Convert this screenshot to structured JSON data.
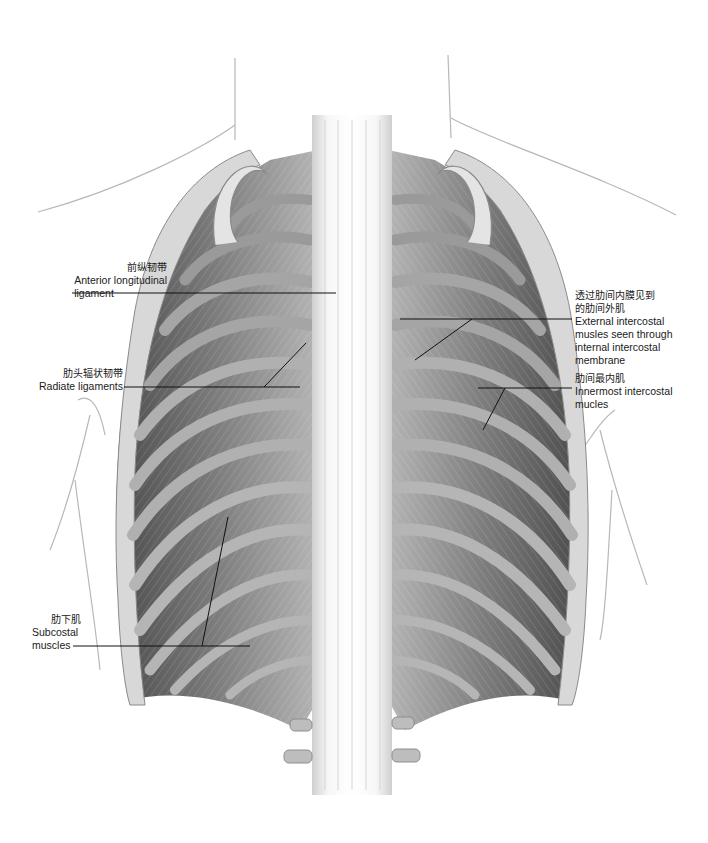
{
  "figure": {
    "labels": [
      {
        "id": "anterior-longitudinal-ligament",
        "zh": "前纵韧带",
        "en": [
          "Anterior longitudinal",
          "ligament"
        ],
        "side": "left"
      },
      {
        "id": "radiate-ligaments",
        "zh": "肋头辐状韧带",
        "en": [
          "Radiate ligaments"
        ],
        "side": "left"
      },
      {
        "id": "subcostal-muscles",
        "zh": "肋下肌",
        "en": [
          "Subcostal",
          "muscles"
        ],
        "side": "left"
      },
      {
        "id": "external-intercostal",
        "zh": [
          "透过肋间内膜见到",
          "的肋间外肌"
        ],
        "en": [
          "External intercostal",
          "musles seen through",
          "internal intercostal",
          "membrane"
        ],
        "side": "right"
      },
      {
        "id": "innermost-intercostal",
        "zh": "肋间最内肌",
        "en": [
          "Innermost intercostal",
          "mucles"
        ],
        "side": "right"
      }
    ],
    "colors": {
      "background": "#ffffff",
      "body_outline": "#b5b5b5",
      "leader_line": "#111111",
      "rib_light": "#d9d9d9",
      "rib_dark": "#5a5a5a",
      "muscle": "#8a8a8a",
      "spine": "#f2f2f2"
    }
  }
}
